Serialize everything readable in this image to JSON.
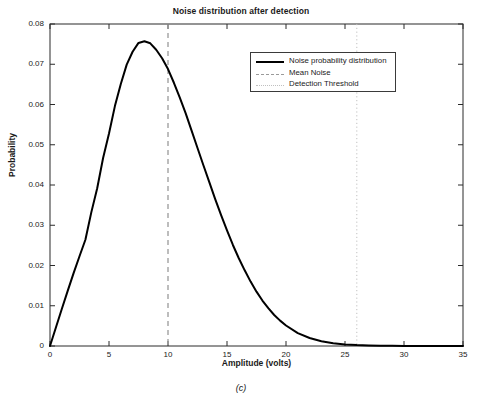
{
  "chart_data": {
    "type": "line",
    "title": "Noise distribution after detection",
    "xlabel": "Amplitude (volts)",
    "ylabel": "Probability",
    "caption": "(c)",
    "xlim": [
      0,
      35
    ],
    "ylim": [
      0,
      0.08
    ],
    "xticks": [
      0,
      5,
      10,
      15,
      20,
      25,
      30,
      35
    ],
    "xtick_labels": [
      "0",
      "5",
      "10",
      "15",
      "20",
      "25",
      "30",
      "35"
    ],
    "yticks": [
      0,
      0.01,
      0.02,
      0.03,
      0.04,
      0.05,
      0.06,
      0.07,
      0.08
    ],
    "ytick_labels": [
      "0",
      "0.01",
      "0.02",
      "0.03",
      "0.04",
      "0.05",
      "0.06",
      "0.07",
      "0.08"
    ],
    "grid": false,
    "legend_position": "upper right",
    "legend": [
      {
        "label": "Noise probability distribution",
        "style": "solid",
        "color": "#000000"
      },
      {
        "label": "Mean Noise",
        "style": "dashed",
        "color": "#9a9a9a"
      },
      {
        "label": "Detection Threshold",
        "style": "dotted",
        "color": "#c0c0c0"
      }
    ],
    "annotations": [
      {
        "name": "mean-noise-line",
        "type": "vline",
        "x": 10,
        "style": "dashed",
        "color": "#9a9a9a"
      },
      {
        "name": "detection-threshold-line",
        "type": "vline",
        "x": 26,
        "style": "dotted",
        "color": "#c0c0c0"
      }
    ],
    "series": [
      {
        "name": "Noise probability distribution",
        "color": "#000000",
        "peak_x": 7.4,
        "peak_y": 0.0757,
        "x": [
          0,
          0.5,
          1,
          1.5,
          2,
          2.5,
          3,
          3.5,
          4,
          4.5,
          5,
          5.5,
          6,
          6.5,
          7,
          7.5,
          8,
          8.5,
          9,
          9.5,
          10,
          10.5,
          11,
          11.5,
          12,
          12.5,
          13,
          13.5,
          14,
          14.5,
          15,
          15.5,
          16,
          16.5,
          17,
          17.5,
          18,
          18.5,
          19,
          19.5,
          20,
          21,
          22,
          23,
          24,
          25,
          26,
          27,
          28,
          29,
          30,
          31,
          32,
          33,
          34,
          35
        ],
        "y": [
          0.0,
          0.0046,
          0.0092,
          0.0137,
          0.0181,
          0.0223,
          0.0264,
          0.0332,
          0.0392,
          0.0467,
          0.0528,
          0.0596,
          0.0651,
          0.0699,
          0.0731,
          0.0753,
          0.0757,
          0.0752,
          0.0736,
          0.0715,
          0.0688,
          0.0654,
          0.0617,
          0.0578,
          0.0535,
          0.0492,
          0.0449,
          0.0407,
          0.0365,
          0.0325,
          0.0287,
          0.0251,
          0.0218,
          0.0188,
          0.016,
          0.0135,
          0.0113,
          0.0094,
          0.0077,
          0.0063,
          0.0051,
          0.0032,
          0.002,
          0.0012,
          0.0007,
          0.0004,
          0.00022,
          0.00013,
          7e-05,
          4e-05,
          2e-05,
          1e-05,
          5e-06,
          2e-06,
          1e-06,
          0.0
        ]
      }
    ]
  }
}
